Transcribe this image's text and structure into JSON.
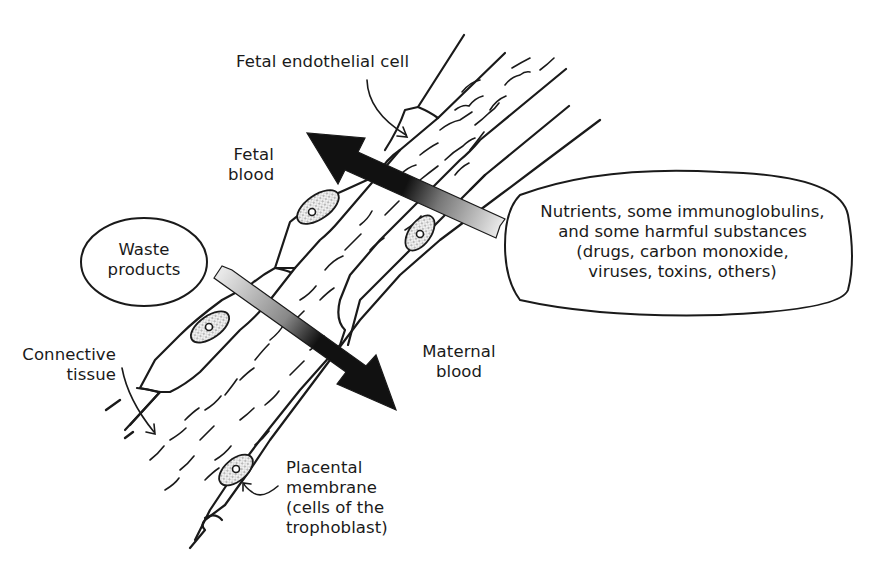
{
  "diagram": {
    "labels": {
      "fetal_endothelial_cell": "Fetal endothelial cell",
      "fetal_blood_line1": "Fetal",
      "fetal_blood_line2": "blood",
      "waste_line1": "Waste",
      "waste_line2": "products",
      "connective_line1": "Connective",
      "connective_line2": "tissue",
      "maternal_line1": "Maternal",
      "maternal_line2": "blood",
      "placental_line1": "Placental",
      "placental_line2": "membrane",
      "placental_line3": "(cells of the",
      "placental_line4": "trophoblast)",
      "nutrients_line1": "Nutrients, some immunoglobulins,",
      "nutrients_line2": "and some harmful substances",
      "nutrients_line3": "(drugs, carbon monoxide,",
      "nutrients_line4": "viruses, toxins, others)"
    },
    "arrows": [
      {
        "name": "maternal-to-fetal",
        "direction": "up-left",
        "source": "Nutrients bubble",
        "target": "Fetal blood"
      },
      {
        "name": "fetal-to-maternal",
        "direction": "down-right",
        "source": "Waste products",
        "target": "Maternal blood"
      }
    ],
    "colors": {
      "ink": "#1a1a1a",
      "background": "#ffffff",
      "stipple": "#d9d9d9"
    }
  }
}
